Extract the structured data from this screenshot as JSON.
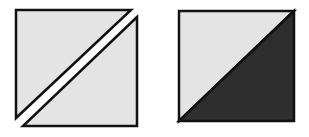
{
  "diagram": {
    "colors": {
      "background": "#ffffff",
      "light_fill": "#e4e4e4",
      "dark_fill": "#2e2e2e",
      "stroke": "#111111"
    },
    "figures": [
      {
        "name": "separated-square",
        "pieces": [
          {
            "name": "upper-left-triangle",
            "fill": "light",
            "points": "16,10 131,10 16,118"
          },
          {
            "name": "lower-right-triangle",
            "fill": "light",
            "points": "137,17 137,126 23,126"
          }
        ]
      },
      {
        "name": "split-square",
        "pieces": [
          {
            "name": "upper-left-triangle",
            "fill": "light",
            "points": "179,11 294,11 179,121"
          },
          {
            "name": "lower-right-triangle",
            "fill": "dark",
            "points": "294,11 294,121 179,121"
          }
        ]
      }
    ]
  }
}
